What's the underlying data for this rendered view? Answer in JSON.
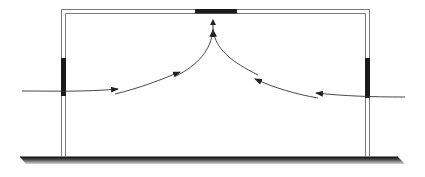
{
  "diagram": {
    "colors": {
      "wall_outline": "#7a7a7a",
      "opening_fill": "#1a1a1a",
      "arrow": "#333333",
      "ground_dark": "#222222",
      "ground_light": "#cfcfcf",
      "background": "#ffffff"
    },
    "elements": {
      "building": {
        "left_wall_x": 61,
        "right_wall_x": 365,
        "top_y": 9,
        "bottom_y": 157,
        "wall_thickness": 5
      },
      "roof_vent": {
        "x": 195,
        "y": 9,
        "width": 42,
        "height": 4
      },
      "left_window": {
        "x": 61,
        "y": 58,
        "width": 5,
        "height": 38
      },
      "right_window": {
        "x": 365,
        "y": 58,
        "width": 5,
        "height": 40
      },
      "ground": {
        "x1": 20,
        "x2": 405,
        "y": 157,
        "depth": 9
      }
    },
    "airflow": [
      {
        "name": "inflow-left",
        "label": "Air inflow from left",
        "segments": 3,
        "direction": "right-then-up"
      },
      {
        "name": "inflow-right",
        "label": "Air inflow from right",
        "segments": 3,
        "direction": "left-then-up"
      },
      {
        "name": "outflow-top",
        "label": "Air exhaust through roof vent",
        "direction": "up"
      }
    ]
  }
}
